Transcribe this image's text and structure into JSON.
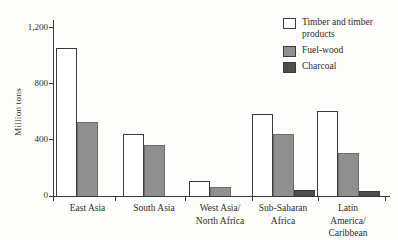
{
  "chart_data": {
    "type": "bar",
    "title": "",
    "xlabel": "",
    "ylabel": "Million tons",
    "ylim": [
      0,
      1200
    ],
    "yticks": [
      0,
      400,
      800,
      1200
    ],
    "ytick_labels": [
      "0",
      "400",
      "800",
      "1,200"
    ],
    "grid": false,
    "legend_position": "top-right",
    "categories": [
      "East Asia",
      "South Asia",
      "West Asia/\nNorth Africa",
      "Sub-Saharan\nAfrica",
      "Latin\nAmerica/\nCaribbean"
    ],
    "series": [
      {
        "name": "Timber and timber products",
        "color": "#ffffff",
        "values": [
          1050,
          440,
          100,
          580,
          600
        ]
      },
      {
        "name": "Fuel-wood",
        "color": "#8f8f8f",
        "values": [
          520,
          360,
          60,
          440,
          300
        ]
      },
      {
        "name": "Charcoal",
        "color": "#4d4d4d",
        "values": [
          0,
          0,
          0,
          40,
          30
        ]
      }
    ],
    "colors": {
      "axis": "#3a3a3a",
      "text": "#2f2b27",
      "background": "#fdfdfb",
      "bar_outline": "#3b3b3b",
      "fuelwood_outline": "#6f6d6a"
    }
  }
}
